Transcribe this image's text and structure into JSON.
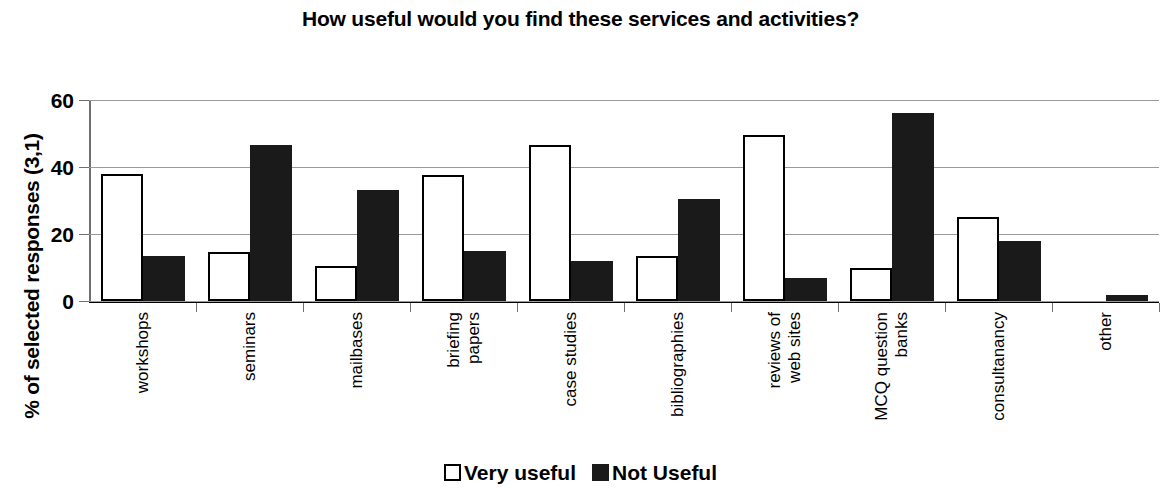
{
  "chart_data": {
    "type": "bar",
    "title": "How useful would you find these services and activities?",
    "xlabel": "",
    "ylabel": "% of selected responses (3,1)",
    "ylim": [
      0,
      60
    ],
    "yticks": [
      0,
      20,
      40,
      60
    ],
    "grid": true,
    "legend_position": "bottom",
    "categories": [
      "workshops",
      "seminars",
      "mailbases",
      "briefing papers",
      "case studies",
      "bibliographies",
      "reviews of web sites",
      "MCQ question banks",
      "consultanancy",
      "other"
    ],
    "category_lines": [
      [
        "workshops"
      ],
      [
        "seminars"
      ],
      [
        "mailbases"
      ],
      [
        "briefing",
        "papers"
      ],
      [
        "case studies"
      ],
      [
        "bibliographies"
      ],
      [
        "reviews of",
        "web sites"
      ],
      [
        "MCQ question",
        "banks"
      ],
      [
        "consultanancy"
      ],
      [
        "other"
      ]
    ],
    "series": [
      {
        "name": "Very useful",
        "color": "#ffffff",
        "edge_color": "#000000",
        "values": [
          38,
          14.5,
          10.5,
          37.5,
          46.5,
          13.5,
          49.5,
          10,
          25,
          0
        ]
      },
      {
        "name": "Not Useful",
        "color": "#1a1a1a",
        "edge_color": "#1a1a1a",
        "values": [
          13.5,
          46.5,
          33,
          15,
          12,
          30.5,
          7,
          56,
          18,
          1.8
        ]
      }
    ]
  },
  "legend": {
    "entries": [
      {
        "label": "Very useful",
        "swatch": "open-square"
      },
      {
        "label": "Not Useful",
        "swatch": "filled-square"
      }
    ]
  }
}
